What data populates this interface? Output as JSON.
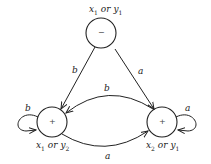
{
  "diagram": {
    "type": "state-machine",
    "nodes": [
      {
        "id": "top",
        "sign": "−",
        "label_var1": "x",
        "label_sub1": "1",
        "label_or": "or",
        "label_var2": "y",
        "label_sub2": "1"
      },
      {
        "id": "left",
        "sign": "+",
        "label_var1": "x",
        "label_sub1": "1",
        "label_or": "or",
        "label_var2": "y",
        "label_sub2": "2"
      },
      {
        "id": "right",
        "sign": "+",
        "label_var1": "x",
        "label_sub1": "2",
        "label_or": "or",
        "label_var2": "y",
        "label_sub2": "1"
      }
    ],
    "edges": [
      {
        "from": "top",
        "to": "left",
        "label": "b"
      },
      {
        "from": "top",
        "to": "right",
        "label": "a"
      },
      {
        "from": "right",
        "to": "left",
        "label": "b"
      },
      {
        "from": "left",
        "to": "right",
        "label": "a"
      },
      {
        "from": "left",
        "to": "left",
        "label": "b"
      },
      {
        "from": "right",
        "to": "right",
        "label": "a"
      }
    ],
    "stroke_color": "#222222"
  }
}
